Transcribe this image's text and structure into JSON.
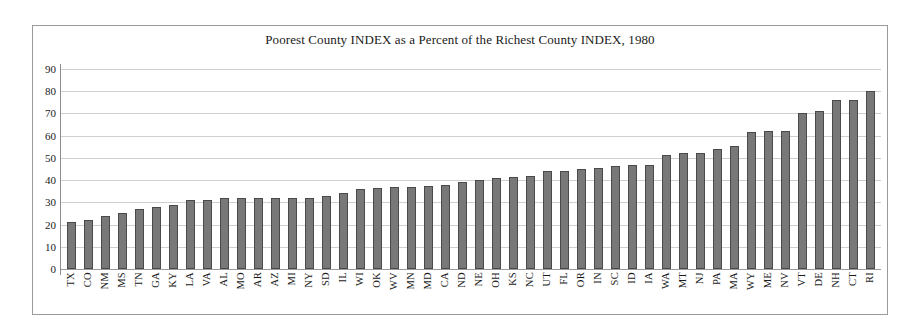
{
  "chart_data": {
    "type": "bar",
    "title": "Poorest County INDEX as a Percent of the Richest County INDEX, 1980",
    "xlabel": "",
    "ylabel": "",
    "ylim": [
      0,
      90
    ],
    "ytick_step": 10,
    "yticks": [
      90,
      80,
      70,
      60,
      50,
      40,
      30,
      20,
      10,
      0
    ],
    "grid": true,
    "legend": "none",
    "bar_color": "#787878",
    "bar_border_color": "#4a4a4a",
    "gridline_color": "#cfcfcf",
    "frame_color": "#9a9a9a",
    "text_color": "#1a1a1a",
    "categories": [
      "TX",
      "CO",
      "NM",
      "MS",
      "TN",
      "GA",
      "KY",
      "LA",
      "VA",
      "AL",
      "MO",
      "AR",
      "AZ",
      "MI",
      "NY",
      "SD",
      "IL",
      "WI",
      "OK",
      "WV",
      "MN",
      "MD",
      "CA",
      "ND",
      "NE",
      "OH",
      "KS",
      "NC",
      "UT",
      "FL",
      "OR",
      "IN",
      "SC",
      "ID",
      "IA",
      "WA",
      "MT",
      "NJ",
      "PA",
      "MA",
      "WY",
      "ME",
      "NV",
      "VT",
      "DE",
      "NH",
      "CT",
      "RI"
    ],
    "values": [
      21,
      22,
      24,
      25,
      27,
      28,
      29,
      31,
      31,
      32,
      32,
      32,
      32,
      32,
      32,
      33,
      34,
      36,
      36.5,
      37,
      37,
      37.5,
      38,
      39,
      40,
      41,
      41.5,
      42,
      44,
      44,
      45,
      45.5,
      46.5,
      47,
      47,
      51.5,
      52,
      52,
      54,
      55.5,
      61.5,
      62,
      62,
      70,
      71,
      76,
      76,
      80
    ]
  }
}
